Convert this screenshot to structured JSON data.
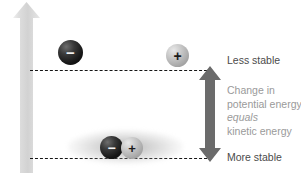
{
  "diagram": {
    "axis": {
      "label": "Potential Energy",
      "direction": "up",
      "icon": "up-arrow-icon"
    },
    "levels": [
      {
        "id": "upper",
        "label": "Less stable",
        "position": "top"
      },
      {
        "id": "lower",
        "label": "More stable",
        "position": "bottom"
      }
    ],
    "delta": {
      "icon": "double-headed-vertical-arrow-icon",
      "lines": [
        "Change in",
        "potential energy",
        "equals",
        "kinetic energy"
      ],
      "emphasis_line": "equals"
    },
    "particles": [
      {
        "id": "neg-high",
        "charge": "−",
        "state": "separated",
        "level": "upper",
        "icon": "negative-charge-sphere-icon"
      },
      {
        "id": "pos-high",
        "charge": "+",
        "state": "separated",
        "level": "upper",
        "icon": "positive-charge-sphere-icon"
      },
      {
        "id": "neg-low",
        "charge": "−",
        "state": "bonded",
        "level": "lower",
        "icon": "negative-charge-sphere-icon"
      },
      {
        "id": "pos-low",
        "charge": "+",
        "state": "bonded",
        "level": "lower",
        "icon": "positive-charge-sphere-icon"
      }
    ],
    "colors": {
      "axis_arrow": "#d9d9d9",
      "axis_label_text": "#ffffff",
      "level_line": "#161616",
      "delta_arrow": "#6b6b6b",
      "strong_text": "#4b4b4b",
      "soft_text": "#9a9a9a",
      "negative_sphere": "#161616",
      "positive_sphere": "#bdbdbd"
    }
  }
}
